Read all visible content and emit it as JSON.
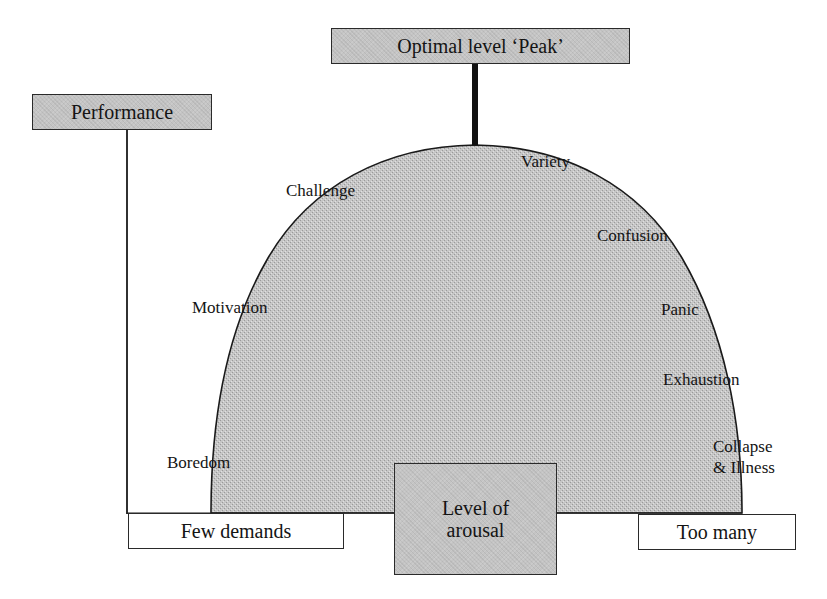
{
  "diagram": {
    "title_box": {
      "text": "Optimal level ‘Peak’"
    },
    "y_axis_box": {
      "text": "Performance"
    },
    "x_axis_center_box": {
      "line1": "Level of",
      "line2": "arousal"
    },
    "x_axis_left_box": {
      "text": "Few demands"
    },
    "x_axis_right_box": {
      "text": "Too many"
    },
    "curve_labels": {
      "left": [
        {
          "text": "Challenge"
        },
        {
          "text": "Motivation"
        },
        {
          "text": "Boredom"
        }
      ],
      "right": [
        {
          "text": "Variety"
        },
        {
          "text": "Confusion"
        },
        {
          "text": "Panic"
        },
        {
          "text": "Exhaustion"
        },
        {
          "text": "Collapse"
        },
        {
          "text": "& Illness"
        }
      ]
    },
    "colors": {
      "shade": "#c4c4c4",
      "ink": "#141414",
      "background": "#ffffff"
    }
  }
}
